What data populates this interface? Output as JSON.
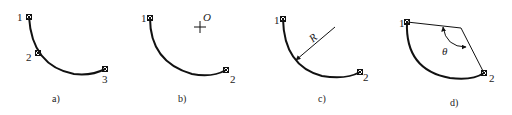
{
  "figure": {
    "panels": [
      {
        "id": "a",
        "caption": "a)",
        "points": [
          {
            "label": "1"
          },
          {
            "label": "2"
          },
          {
            "label": "3"
          }
        ]
      },
      {
        "id": "b",
        "caption": "b)",
        "points": [
          {
            "label": "1"
          },
          {
            "label": "2"
          }
        ],
        "center_label": "O"
      },
      {
        "id": "c",
        "caption": "c)",
        "points": [
          {
            "label": "1"
          },
          {
            "label": "2"
          }
        ],
        "radius_label": "R"
      },
      {
        "id": "d",
        "caption": "d)",
        "points": [
          {
            "label": "1"
          },
          {
            "label": "2"
          }
        ],
        "angle_label": "θ"
      }
    ],
    "colors": {
      "stroke": "#111111",
      "text": "#222222",
      "background": "#ffffff"
    }
  }
}
